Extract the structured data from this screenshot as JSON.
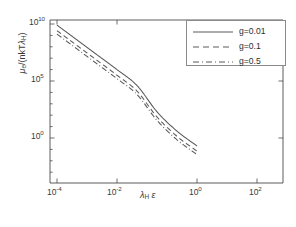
{
  "chart_data": {
    "type": "line",
    "title": "",
    "xlabel": "λH ε",
    "ylabel": "μe/(nkTλH)",
    "xscale": "log",
    "yscale": "log",
    "xlim": [
      0.0001,
      1200.0
    ],
    "ylim": [
      0.001,
      20000000000.0
    ],
    "grid": false,
    "legend_position": "top-right",
    "xticks": [
      {
        "value": 0.0001,
        "mantissa": "10",
        "exponent": "-4"
      },
      {
        "value": 0.01,
        "mantissa": "10",
        "exponent": "-2"
      },
      {
        "value": 1.0,
        "mantissa": "10",
        "exponent": "0"
      },
      {
        "value": 100.0,
        "mantissa": "10",
        "exponent": "2"
      }
    ],
    "yticks": [
      {
        "value": 10000000000.0,
        "mantissa": "10",
        "exponent": "10"
      },
      {
        "value": 100000.0,
        "mantissa": "10",
        "exponent": "5"
      },
      {
        "value": 1.0,
        "mantissa": "10",
        "exponent": "0"
      }
    ],
    "x": [
      0.0001,
      0.001,
      0.01,
      0.1,
      1.0,
      10.0,
      100.0,
      1000.0
    ],
    "series": [
      {
        "name": "g=0.01",
        "style": "solid",
        "color": "#5a5a5a",
        "values": [
          8000000000.0,
          400000000.0,
          20000000.0,
          1000000.0,
          40000.0,
          200.0,
          4.0,
          0.2
        ]
      },
      {
        "name": "g=0.1",
        "style": "dashed",
        "color": "#5a5a5a",
        "values": [
          2600000000.0,
          130000000.0,
          6500000.0,
          320000.0,
          13000.0,
          70.0,
          1.4,
          0.07
        ]
      },
      {
        "name": "g=0.5",
        "style": "dashdot",
        "color": "#5a5a5a",
        "values": [
          1300000000.0,
          65000000.0,
          3200000.0,
          160000.0,
          6500.0,
          35.0,
          0.7,
          0.035
        ]
      }
    ]
  },
  "axis": {
    "ylabel_prefix": "μ",
    "ylabel_sub": "e",
    "ylabel_mid": "/(nkT",
    "ylabel_lambda": "λ",
    "ylabel_lambda_sub": "H",
    "ylabel_suffix": ")",
    "xlabel_lambda": "λ",
    "xlabel_lambda_sub": "H",
    "xlabel_eps": "ε"
  },
  "ticklabels": {
    "x": [
      "10-4",
      "10-2",
      "100",
      "102"
    ],
    "y": [
      "1010",
      "105",
      "100"
    ]
  },
  "legend": {
    "entries": [
      {
        "label": "g=0.01",
        "style": "solid"
      },
      {
        "label": "g=0.1",
        "style": "dashed"
      },
      {
        "label": "g=0.5",
        "style": "dashdot"
      }
    ]
  },
  "colors": {
    "axis": "#4a4a4a",
    "curve": "#5a5a5a",
    "legend_border": "#8a8a8a",
    "text": "#3b3b3b",
    "background": "#ffffff"
  }
}
